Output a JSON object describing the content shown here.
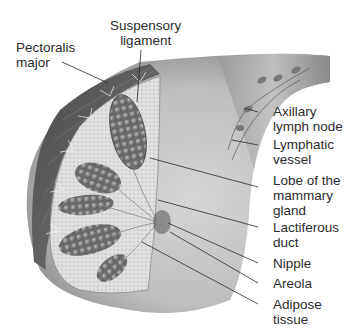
{
  "diagram": {
    "labels": [
      {
        "id": "pectoralis-major",
        "lines": [
          "Pectoralis",
          "major"
        ]
      },
      {
        "id": "suspensory-ligament",
        "lines": [
          "Suspensory",
          "ligament"
        ]
      },
      {
        "id": "axillary-lymph-node",
        "lines": [
          "Axillary",
          "lymph node"
        ]
      },
      {
        "id": "lymphatic-vessel",
        "lines": [
          "Lymphatic",
          "vessel"
        ]
      },
      {
        "id": "lobe-of-mammary-gland",
        "lines": [
          "Lobe of the",
          "mammary",
          "gland"
        ]
      },
      {
        "id": "lactiferous-duct",
        "lines": [
          "Lactiferous",
          "duct"
        ]
      },
      {
        "id": "nipple",
        "lines": [
          "Nipple"
        ]
      },
      {
        "id": "areola",
        "lines": [
          "Areola"
        ]
      },
      {
        "id": "adipose-tissue",
        "lines": [
          "Adipose",
          "tissue"
        ]
      }
    ],
    "colors": {
      "skin": "#c9c9c9",
      "skin_dark": "#6e6e6e",
      "muscle": "#5a5a5a",
      "fat": "#dcdcdc",
      "lobule": "#7a7a7a",
      "leader": "#2a2a2a"
    }
  }
}
